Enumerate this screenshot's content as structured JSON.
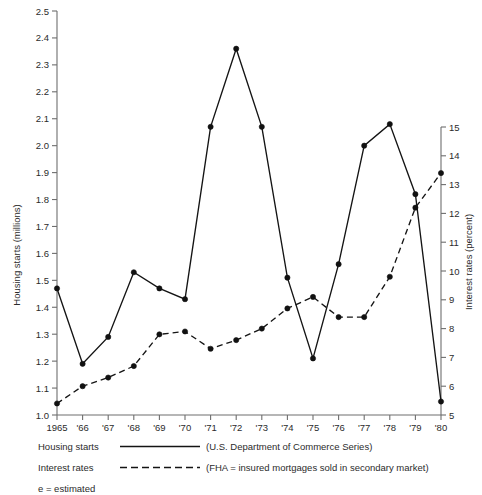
{
  "chart_data": {
    "type": "line",
    "title": "",
    "xlabel": "",
    "ylabel": "Housing starts (millions)",
    "y2label": "Interest rates (percent)",
    "grid": false,
    "legend_position": "below-plot",
    "x": [
      1965,
      1966,
      1967,
      1968,
      1969,
      1970,
      1971,
      1972,
      1973,
      1974,
      1975,
      1976,
      1977,
      1978,
      1979,
      1980
    ],
    "categories": [
      "1965",
      "'66",
      "'67",
      "'68",
      "'69",
      "'70",
      "'71",
      "'72",
      "'73",
      "'74",
      "'75",
      "'76",
      "'77",
      "'78",
      "'79",
      "'80"
    ],
    "ylim": [
      1.0,
      2.5
    ],
    "yticks": [
      "1.0",
      "1.1",
      "1.2",
      "1.3",
      "1.4",
      "1.5",
      "1.6",
      "1.7",
      "1.8",
      "1.9",
      "2.0",
      "2.1",
      "2.2",
      "2.3",
      "2.4",
      "2.5"
    ],
    "y2lim": [
      5,
      15
    ],
    "y2ticks": [
      "5",
      "6",
      "7",
      "8",
      "9",
      "10",
      "11",
      "12",
      "13",
      "14",
      "15"
    ],
    "series": [
      {
        "name": "Housing starts",
        "style": "solid",
        "axis": "left",
        "units": "millions",
        "values": [
          1.47,
          1.19,
          1.29,
          1.53,
          1.47,
          1.43,
          2.07,
          2.36,
          2.07,
          1.51,
          1.21,
          1.56,
          2.0,
          2.08,
          1.82,
          1.05
        ]
      },
      {
        "name": "Interest rates",
        "style": "dashed",
        "axis": "right",
        "units": "percent",
        "values": [
          5.4,
          6.0,
          6.3,
          6.7,
          7.8,
          7.9,
          7.3,
          7.6,
          8.0,
          8.7,
          9.1,
          8.4,
          8.4,
          9.8,
          12.2,
          13.4
        ]
      }
    ],
    "annotations": [
      "e = estimated"
    ]
  },
  "legend": {
    "rows": [
      {
        "label": "Housing starts",
        "style": "solid",
        "note": "(U.S. Department of Commerce Series)"
      },
      {
        "label": "Interest rates",
        "style": "dashed",
        "note": "(FHA = insured mortgages sold in secondary market)"
      }
    ],
    "footnote": "e = estimated"
  },
  "axes": {
    "left_title": "Housing starts (millions)",
    "right_title": "Interest rates (percent)"
  },
  "colors": {
    "ink": "#141414",
    "axis": "#6e6e6e",
    "background": "#ffffff"
  }
}
